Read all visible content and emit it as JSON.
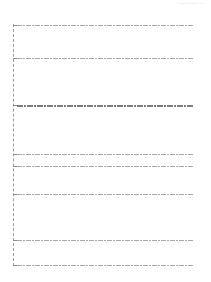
{
  "header": {
    "left_text": "",
    "right_text": "illegible header text"
  },
  "tree": {
    "rows": [
      {
        "text": "illegible row text",
        "y": 24,
        "bold": false
      },
      {
        "text": "illegible row text",
        "y": 57,
        "bold": false
      },
      {
        "text": "illegible row text",
        "y": 105,
        "bold": true
      },
      {
        "text": "illegible row text",
        "y": 153,
        "bold": false
      },
      {
        "text": "illegible row text",
        "y": 165,
        "bold": false
      },
      {
        "text": "illegible row text",
        "y": 193,
        "bold": false
      },
      {
        "text": "illegible row text",
        "y": 239,
        "bold": false
      },
      {
        "text": "illegible row text",
        "y": 264,
        "bold": false
      }
    ]
  }
}
